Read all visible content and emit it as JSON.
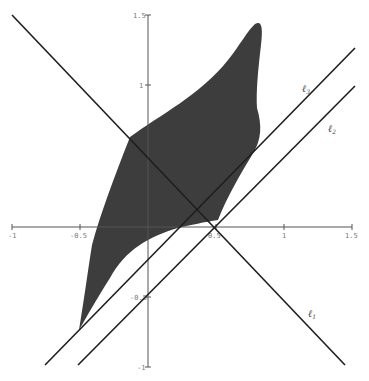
{
  "figure": {
    "type": "geometric-diagram",
    "colors": {
      "region_fill": "#3d3d3d",
      "line": "#1e1e1e",
      "axis": "#555555",
      "tick_label": "#777777",
      "background": "#ffffff"
    }
  },
  "axes": {
    "x_ticks": [
      {
        "value": -1,
        "label": "-1"
      },
      {
        "value": -0.5,
        "label": "-0.5"
      },
      {
        "value": 0.5,
        "label": "0.5"
      },
      {
        "value": 1,
        "label": "1"
      },
      {
        "value": 1.5,
        "label": "1.5"
      }
    ],
    "y_ticks": [
      {
        "value": 1.5,
        "label": "1.5"
      },
      {
        "value": 1,
        "label": "1"
      },
      {
        "value": -0.5,
        "label": "-0.5"
      },
      {
        "value": -1,
        "label": "-1"
      }
    ],
    "xlim": [
      -1,
      1.5
    ],
    "ylim": [
      -1,
      1.5
    ]
  },
  "lines": [
    {
      "name": "l1",
      "label": "ℓ",
      "subscript": "1",
      "direction": "descending"
    },
    {
      "name": "l2",
      "label": "ℓ",
      "subscript": "2",
      "direction": "ascending"
    },
    {
      "name": "l3",
      "label": "ℓ",
      "subscript": "3",
      "direction": "ascending"
    }
  ]
}
